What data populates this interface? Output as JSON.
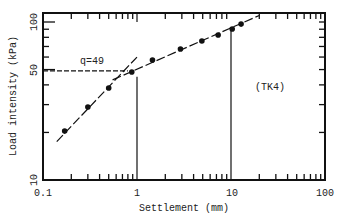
{
  "chart_data": {
    "type": "scatter",
    "title": "",
    "xlabel": "Settlement (mm)",
    "ylabel": "Load intensity (kPa)",
    "xscale": "log",
    "yscale": "log",
    "xlim": [
      0.1,
      100
    ],
    "ylim": [
      10,
      114
    ],
    "x_ticks": [
      0.1,
      1,
      10,
      100
    ],
    "x_tick_labels": [
      "0.1",
      "1",
      "10",
      "100"
    ],
    "y_ticks": [
      10,
      50,
      100
    ],
    "y_tick_labels": [
      "10",
      "50",
      "100"
    ],
    "grid": false,
    "legend": null,
    "series": [
      {
        "name": "TK4",
        "marker": "filled-circle",
        "x": [
          0.17,
          0.3,
          0.5,
          0.88,
          1.46,
          2.9,
          4.9,
          7.3,
          10.3,
          12.8
        ],
        "y": [
          20.4,
          29.0,
          38.2,
          48.3,
          57.5,
          67.5,
          75.8,
          82.7,
          90.3,
          97.0
        ]
      }
    ],
    "fit_lines": [
      {
        "name": "initial-segment",
        "style": "dash-dot",
        "from": [
          0.14,
          17.5
        ],
        "to": [
          1.0,
          60
        ]
      },
      {
        "name": "final-segment",
        "style": "dash-dot",
        "from": [
          0.55,
          43
        ],
        "to": [
          20,
          110
        ]
      }
    ],
    "reference_lines": [
      {
        "type": "horizontal-dashed",
        "y": 49,
        "x_from": 0.1,
        "x_to": 0.8
      },
      {
        "type": "vertical",
        "x": 1,
        "y_from": 10,
        "y_to": 45
      },
      {
        "type": "vertical",
        "x": 1,
        "y_from": 100,
        "y_to": 114
      },
      {
        "type": "vertical",
        "x": 10,
        "y_from": 10,
        "y_to": 88
      }
    ],
    "annotations": [
      {
        "text": "q=49",
        "x": 0.35,
        "y": 53
      },
      {
        "text": "(TK4)",
        "x": 18,
        "y": 38
      }
    ]
  },
  "labels": {
    "xlabel": "Settlement (mm)",
    "ylabel": "Load intensity (kPa)",
    "q_annotation": "q=49",
    "series_tag": "(TK4)",
    "x_tick_labels": [
      "0.1",
      "1",
      "10",
      "100"
    ],
    "y_tick_labels": [
      "10",
      "50",
      "100"
    ]
  }
}
